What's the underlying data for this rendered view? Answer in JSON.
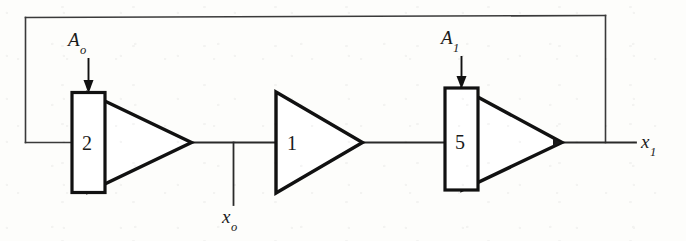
{
  "figure": {
    "type": "block-diagram",
    "background_color": "#fdfdfb",
    "line_color": "#1a1a1a"
  },
  "labels": {
    "gain_control_0": {
      "symbol": "A",
      "subscript": "o",
      "text": "A"
    },
    "gain_control_1": {
      "symbol": "A",
      "subscript": "1",
      "text": "A"
    },
    "signal_intermediate": {
      "symbol": "x",
      "subscript": "o",
      "text": "x"
    },
    "signal_output": {
      "symbol": "x",
      "subscript": "1",
      "text": "x"
    }
  },
  "stages": [
    {
      "name": "stage-1",
      "gain_value": "2",
      "shape": "rectangle-plus-triangle",
      "control_input": "A",
      "control_subscript": "o"
    },
    {
      "name": "stage-2",
      "gain_value": "1",
      "shape": "triangle",
      "control_input": null,
      "control_subscript": null
    },
    {
      "name": "stage-3",
      "gain_value": "5",
      "shape": "rectangle-plus-triangle",
      "control_input": "A",
      "control_subscript": "1"
    }
  ],
  "connections": {
    "feedback_loop": "output x1 routed back to input of stage-1",
    "tap_intermediate": "x_o tapped between stage-1 and stage-2",
    "tap_output": "x_1 taken after stage-3"
  }
}
